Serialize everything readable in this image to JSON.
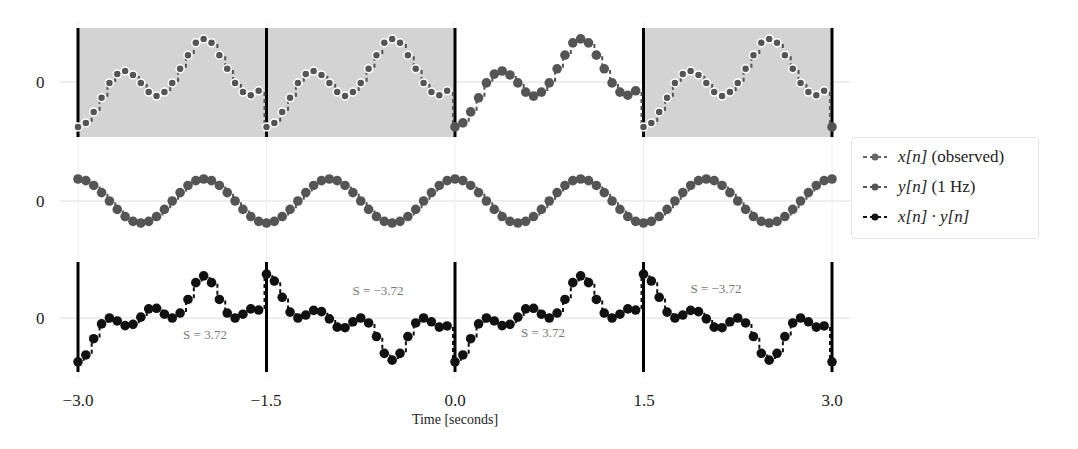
{
  "chart_data": [
    {
      "type": "scatter",
      "panel": "top",
      "title": "",
      "ylabel_ticks": [
        "0"
      ],
      "series": [
        {
          "name": "x[n] (observed)",
          "color": "#555555"
        }
      ],
      "sample_rate_hz": 16,
      "period_seconds": 1.5,
      "one_period_values": [
        -1.02,
        -0.93,
        -0.68,
        -0.36,
        -0.02,
        0.18,
        0.25,
        0.16,
        -0.02,
        -0.23,
        -0.32,
        -0.23,
        -0.02,
        0.3,
        0.61,
        0.89,
        0.98,
        0.89,
        0.61,
        0.3,
        -0.02,
        -0.23,
        -0.3,
        -0.2
      ],
      "shaded_windows": [
        [
          -3.0,
          -1.5
        ],
        [
          -1.5,
          0.0
        ],
        [
          1.5,
          3.0
        ]
      ],
      "window_boundaries": [
        -3.0,
        -1.5,
        0.0,
        1.5,
        3.0
      ],
      "xlim": [
        -3.0,
        3.0
      ]
    },
    {
      "type": "scatter",
      "panel": "middle",
      "ylabel_ticks": [
        "0"
      ],
      "series": [
        {
          "name": "y[n] (1 Hz)",
          "color": "#555555",
          "formula": "cos(2*pi*1*t)"
        }
      ],
      "xlim": [
        -3.0,
        3.0
      ]
    },
    {
      "type": "scatter",
      "panel": "bottom",
      "ylabel_ticks": [
        "0"
      ],
      "series": [
        {
          "name": "x[n] · y[n]",
          "color": "#111111"
        }
      ],
      "annotations": [
        {
          "text": "S = 3.72",
          "t": -2.25
        },
        {
          "text": "S = −3.72",
          "t": -0.6
        },
        {
          "text": "S = 3.72",
          "t": 0.75
        },
        {
          "text": "S = −3.72",
          "t": 2.05
        }
      ],
      "window_boundaries": [
        -3.0,
        -1.5,
        0.0,
        1.5,
        3.0
      ],
      "xlim": [
        -3.0,
        3.0
      ]
    }
  ],
  "axes": {
    "x_ticks": [
      "−3.0",
      "−1.5",
      "0.0",
      "1.5",
      "3.0"
    ],
    "x_tick_values": [
      -3.0,
      -1.5,
      0.0,
      1.5,
      3.0
    ],
    "xlabel": "Time [seconds]",
    "y_tick_label": "0"
  },
  "legend": {
    "items": [
      {
        "var": "x[n]",
        "suffix": " (observed)",
        "color": "#666666"
      },
      {
        "var": "y[n]",
        "suffix": " (1 Hz)",
        "color": "#555555"
      },
      {
        "var": "x[n] · y[n]",
        "suffix": "",
        "color": "#111111"
      }
    ]
  },
  "annotations": {
    "s1": "S = 3.72",
    "s2": "S = −3.72",
    "s3": "S = 3.72",
    "s4": "S = −3.72"
  },
  "colors": {
    "shade": "#d3d3d3",
    "marker": "#555555",
    "product_marker": "#111111",
    "grid": "#dddddd",
    "boundary": "#000000"
  }
}
